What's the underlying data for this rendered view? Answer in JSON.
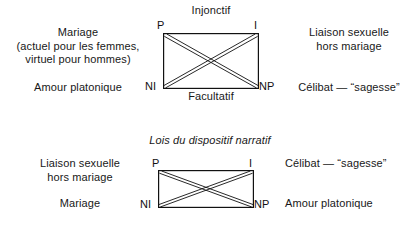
{
  "diagrams": [
    {
      "id": "semiotic-square-1",
      "top_caption": "Injonctif",
      "bottom_caption": "Facultatif",
      "vertices": {
        "top_left": "P",
        "top_right": "I",
        "bottom_left": "NI",
        "bottom_right": "NP"
      },
      "annotations": {
        "top_left_text": "Mariage\n(actuel pour les femmes,\nvirtuel pour hommes)",
        "top_right_text": "Liaison sexuelle\nhors mariage",
        "bottom_left_text": "Amour platonique",
        "bottom_right_text": "Célibat — “sagesse”"
      }
    },
    {
      "id": "semiotic-square-2",
      "top_caption": "Lois du dispositif narratif",
      "bottom_caption": "",
      "vertices": {
        "top_left": "P",
        "top_right": "I",
        "bottom_left": "NI",
        "bottom_right": "NP"
      },
      "annotations": {
        "top_left_text": "Liaison sexuelle\nhors mariage",
        "top_right_text": "Célibat — “sagesse”",
        "bottom_left_text": "Mariage",
        "bottom_right_text": "Amour platonique"
      }
    }
  ],
  "style": {
    "stroke_color": "#111111",
    "text_color": "#181818",
    "background": "#ffffff"
  }
}
